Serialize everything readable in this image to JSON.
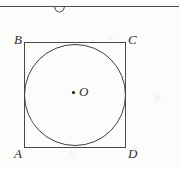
{
  "figure": {
    "caption_labels": {
      "vertex_a": "A",
      "vertex_b": "B",
      "vertex_c": "C",
      "vertex_d": "D",
      "center": "O"
    },
    "colors": {
      "stroke": "#3b3b3b",
      "square_stroke": "#4a4a4a",
      "circle_stroke": "#3f3f3f",
      "center_dot": "#1c1c1c",
      "label": "#2e2e2e",
      "background": "#fcfcfb",
      "rule_line": "#4f4f4f"
    },
    "geometry": {
      "square": {
        "label": "square-ABCD",
        "x": 24,
        "y": 42,
        "width": 102,
        "height": 106,
        "stroke_width": 1
      },
      "inscribed_circle": {
        "label": "circle-O",
        "cx": 75,
        "cy": 95,
        "r": 51,
        "stroke_width": 1
      },
      "center_dot": {
        "cx": 73.5,
        "cy": 92.5,
        "r": 1.6
      },
      "top_rule": {
        "label": "horizontal-rule",
        "x1": 0,
        "y1": 6,
        "x2": 179,
        "y2": 6,
        "stroke_width": 1
      },
      "top_arc": {
        "label": "cropped-arc-glyph",
        "cx": 59.5,
        "cy": 6,
        "rx": 5,
        "ry": 6,
        "stroke_width": 1
      }
    }
  }
}
